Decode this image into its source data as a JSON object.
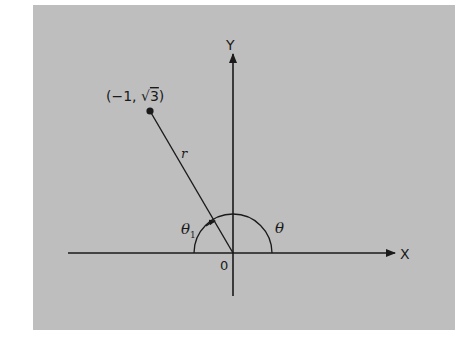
{
  "diagram": {
    "type": "polar-coordinates-angle",
    "axes": {
      "x_label": "X",
      "y_label": "Y",
      "origin_label": "0"
    },
    "point": {
      "label": "(−1, √3)",
      "label_prefix": "(−1, ",
      "label_sqrt_symbol": "√",
      "label_radicand": "3",
      "label_suffix": ")",
      "x": -1,
      "y_text": "√3"
    },
    "radius_label": "r",
    "angles": {
      "theta": "θ",
      "theta1_symbol": "θ",
      "theta1_subscript": "1"
    },
    "colors": {
      "background": "#bebebe",
      "ink": "#1a1a1a"
    }
  }
}
